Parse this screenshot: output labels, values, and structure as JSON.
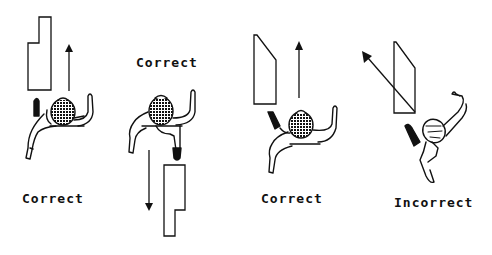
{
  "figure": {
    "type": "instructional-diagram",
    "colors": {
      "ink": "#111111",
      "background": "#ffffff"
    },
    "panels": [
      {
        "id": 1,
        "label": "Correct",
        "arrow_direction": "up",
        "object_shape": "stepped-rectangle",
        "label_position": "below"
      },
      {
        "id": 2,
        "label": "Correct",
        "arrow_direction": "down",
        "object_shape": "stepped-rectangle",
        "label_position": "above"
      },
      {
        "id": 3,
        "label": "Correct",
        "arrow_direction": "up",
        "object_shape": "slanted-top-rectangle",
        "label_position": "below"
      },
      {
        "id": 4,
        "label": "Incorrect",
        "arrow_direction": "up-left diagonal (crossing object)",
        "object_shape": "slanted-top-rectangle",
        "label_position": "below"
      }
    ]
  }
}
